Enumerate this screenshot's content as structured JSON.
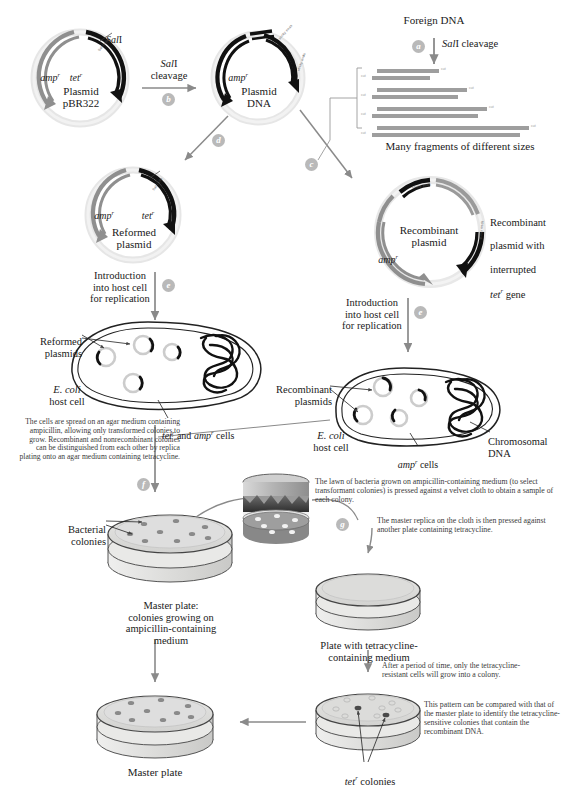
{
  "figure": {
    "colors": {
      "plasmid_backbone": "#e3e3e3",
      "amp_gene": "#8f8f8f",
      "tet_gene": "#141414",
      "arrow": "#8a8a8a",
      "step_badge": "#b9b9b9",
      "agar": "#d8d8d6",
      "colony": "#8a8a8a",
      "velvet_dark": "#3c3c3c",
      "text": "#1a1a1a",
      "body_text": "#3a3a3a"
    }
  },
  "steps": [
    {
      "id": "a",
      "letter": "a"
    },
    {
      "id": "b",
      "letter": "b"
    },
    {
      "id": "c",
      "letter": "c"
    },
    {
      "id": "d",
      "letter": "d"
    },
    {
      "id": "e1",
      "letter": "e"
    },
    {
      "id": "e2",
      "letter": "e"
    },
    {
      "id": "f",
      "letter": "f"
    },
    {
      "id": "g",
      "letter": "g"
    }
  ],
  "plasmid_pbr322": {
    "name_line1": "Plasmid",
    "name_line2": "pBR322",
    "amp_label": "amp",
    "amp_sup": "r",
    "tet_label": "tet",
    "tet_sup": "r",
    "site_label": "Sal I",
    "site_tick_label": "Sal I site"
  },
  "cleavage": {
    "label_line1": "Sal I",
    "label_line2": "cleavage"
  },
  "plasmid_dna": {
    "name_line1": "Plasmid",
    "name_line2": "DNA",
    "amp_label": "amp",
    "amp_sup": "r",
    "sticky_end_left": "sticky ends",
    "sticky_end_right": "sticky ends"
  },
  "foreign_dna": {
    "title": "Foreign DNA",
    "cleavage_label": "Sal I cleavage",
    "fragments_caption": "Many fragments of different sizes",
    "fragments": [
      {
        "top_width": 62,
        "bottom_width": 58,
        "tag": "cut"
      },
      {
        "top_width": 90,
        "bottom_width": 86,
        "tag": "cut"
      },
      {
        "top_width": 110,
        "bottom_width": 106,
        "tag": "cut"
      },
      {
        "top_width": 152,
        "bottom_width": 148,
        "tag": "cut"
      }
    ]
  },
  "reformed_plasmid": {
    "name_line1": "Reformed",
    "name_line2": "plasmid",
    "amp_label": "amp",
    "amp_sup": "r",
    "tet_label": "tet",
    "tet_sup": "r"
  },
  "recombinant_plasmid": {
    "name_line1": "Recombinant",
    "name_line2": "plasmid",
    "amp_label": "amp",
    "amp_sup": "r",
    "side_note": "Recombinant\nplasmid with\ninterrupted\ntet  gene",
    "side_note_l1": "Recombinant",
    "side_note_l2": "plasmid with",
    "side_note_l3": "interrupted",
    "side_note_l4_italic": "tet",
    "side_note_l4_sup": "r",
    "side_note_l4_rest": " gene"
  },
  "introduction_left": {
    "line1": "Introduction",
    "line2": "into host cell",
    "line3": "for replication"
  },
  "introduction_right": {
    "line1": "Introduction",
    "line2": "into host cell",
    "line3": "for replication"
  },
  "cell_left": {
    "plasmid_label_l1": "Reformed",
    "plasmid_label_l2": "plasmids",
    "host_l1": "E. coli",
    "host_l2": "host cell",
    "cells_label_tet": "tet",
    "cells_label_tet_sup": "r",
    "cells_label_and": " and ",
    "cells_label_amp": "amp",
    "cells_label_amp_sup": "r",
    "cells_label_tail": " cells"
  },
  "cell_right": {
    "plasmid_label_l1": "Recombinant",
    "plasmid_label_l2": "plasmids",
    "host_l1": "E. coli",
    "host_l2": "host cell",
    "cells_label_amp": "amp",
    "cells_label_amp_sup": "r",
    "cells_label_tail": " cells",
    "chromosome_l1": "Chromosomal",
    "chromosome_l2": "DNA"
  },
  "spread_text": "The cells are spread on an agar medium containing ampicillin, allowing only transformed colonies to grow. Recombinant and nonrecombinant colonies can be distinguished from each other by replica plating onto an agar medium containing tetracycline.",
  "velvet_text": "The lawn of bacteria grown on ampicillin-containing medium (to select transformant colonies) is pressed against a velvet cloth to obtain a sample of each colony.",
  "replica_text": "The master replica on the cloth is then pressed against another plate containing tetracycline.",
  "period_text": "After a period of time, only the tetracycline-resistant cells will grow into a colony.",
  "compare_text": "This pattern can be compared with that of the master plate to identify the tetracycline-sensitive colonies that contain the recombinant DNA.",
  "bacterial_colonies_label": {
    "line1": "Bacterial",
    "line2": "colonies"
  },
  "master_plate_top": {
    "line1": "Master plate:",
    "line2": "colonies growing on",
    "line3": "ampicillin-containing",
    "line4": "medium"
  },
  "tet_plate": {
    "line1": "Plate with tetracycline-",
    "line2": "containing medium"
  },
  "master_plate_bottom": {
    "label": "Master plate"
  },
  "tet_colonies": {
    "italic": "tet",
    "sup": "r",
    "rest": " colonies"
  }
}
